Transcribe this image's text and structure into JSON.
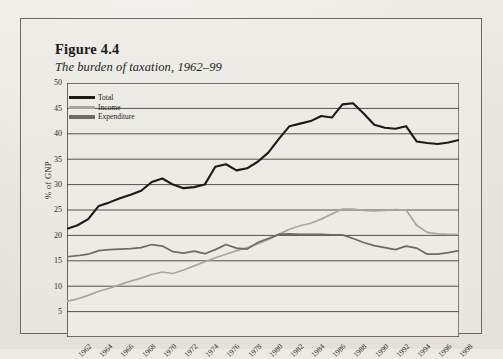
{
  "figure": {
    "number": "Figure 4.4",
    "caption": "The burden of taxation, 1962–99"
  },
  "legend": {
    "position": "top-left-inside",
    "items": [
      {
        "label": "Total",
        "color": "#1c1a17"
      },
      {
        "label": "Income",
        "color": "#a9a6a0"
      },
      {
        "label": "Expenditure",
        "color": "#6e6b65"
      }
    ]
  },
  "chart_data": {
    "type": "line",
    "title": "The burden of taxation, 1962–99",
    "xlabel": "",
    "ylabel": "% of GNP",
    "ylim": [
      0,
      50
    ],
    "yticks": [
      5,
      10,
      15,
      20,
      25,
      30,
      35,
      40,
      45,
      50
    ],
    "grid": true,
    "xlim": [
      1962,
      1999
    ],
    "xticks": [
      1962,
      1964,
      1966,
      1968,
      1970,
      1972,
      1974,
      1976,
      1978,
      1980,
      1982,
      1984,
      1986,
      1988,
      1990,
      1992,
      1994,
      1996,
      1998
    ],
    "xtick_labels": [
      "1962",
      "1964",
      "1966",
      "1968",
      "1970",
      "1972",
      "1974",
      "1976",
      "1978",
      "1980",
      "1982",
      "1984",
      "1986",
      "1988",
      "1990",
      "1992",
      "1994",
      "1996",
      "1998"
    ],
    "x": [
      1962,
      1963,
      1964,
      1965,
      1966,
      1967,
      1968,
      1969,
      1970,
      1971,
      1972,
      1973,
      1974,
      1975,
      1976,
      1977,
      1978,
      1979,
      1980,
      1981,
      1982,
      1983,
      1984,
      1985,
      1986,
      1987,
      1988,
      1989,
      1990,
      1991,
      1992,
      1993,
      1994,
      1995,
      1996,
      1997,
      1998,
      1999
    ],
    "series": [
      {
        "name": "Total",
        "color": "#1c1a17",
        "values": [
          21.3,
          22.0,
          23.2,
          25.8,
          26.5,
          27.3,
          28.0,
          28.8,
          30.5,
          31.2,
          30.0,
          29.3,
          29.5,
          30.0,
          33.5,
          34.0,
          32.8,
          33.2,
          34.5,
          36.3,
          39.0,
          41.5,
          42.0,
          42.5,
          43.5,
          43.2,
          45.8,
          46.0,
          44.0,
          41.8,
          41.2,
          41.0,
          41.5,
          38.5,
          38.2,
          38.0,
          38.3,
          38.8
        ]
      },
      {
        "name": "Income",
        "color": "#a9a6a0",
        "values": [
          7.0,
          7.5,
          8.2,
          9.0,
          9.6,
          10.3,
          11.0,
          11.6,
          12.3,
          12.8,
          12.5,
          13.2,
          14.0,
          14.8,
          15.6,
          16.3,
          17.0,
          17.6,
          18.3,
          19.2,
          20.2,
          21.2,
          21.9,
          22.4,
          23.2,
          24.2,
          25.2,
          25.2,
          24.9,
          24.8,
          24.9,
          25.1,
          25.0,
          22.0,
          20.6,
          20.3,
          20.2,
          20.2
        ]
      },
      {
        "name": "Expenditure",
        "color": "#6e6b65",
        "values": [
          15.8,
          16.0,
          16.3,
          17.0,
          17.2,
          17.3,
          17.4,
          17.6,
          18.2,
          17.9,
          16.8,
          16.5,
          16.9,
          16.4,
          17.2,
          18.2,
          17.5,
          17.3,
          18.6,
          19.4,
          20.2,
          20.3,
          20.2,
          20.2,
          20.2,
          20.1,
          20.1,
          19.4,
          18.6,
          18.0,
          17.6,
          17.2,
          17.9,
          17.5,
          16.3,
          16.3,
          16.6,
          17.0
        ]
      }
    ]
  }
}
